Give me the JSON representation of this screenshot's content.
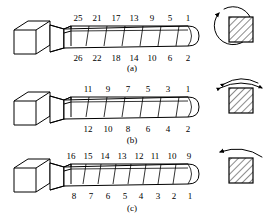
{
  "figure": {
    "panels": [
      {
        "id": "a",
        "caption": "(a)",
        "segment_count": 7,
        "top_numbers": [
          "25",
          "21",
          "17",
          "13",
          "9",
          "5",
          "1"
        ],
        "bottom_numbers": [
          "26",
          "22",
          "18",
          "14",
          "10",
          "6",
          "2"
        ],
        "cross_section": {
          "shape": "hatched-square",
          "arrow": "full-circle-rotation-arrow",
          "arrow_direction": "clockwise"
        }
      },
      {
        "id": "b",
        "caption": "(b)",
        "segment_count": 7,
        "top_numbers": [
          "11",
          "9",
          "7",
          "5",
          "3",
          "1"
        ],
        "bottom_numbers": [
          "12",
          "10",
          "8",
          "6",
          "4",
          "2"
        ],
        "cross_section": {
          "shape": "hatched-square",
          "arrow": "double-headed-arc-arrow",
          "arrow_direction": "bidirectional"
        }
      },
      {
        "id": "c",
        "caption": "(c)",
        "segment_count": 8,
        "top_numbers": [
          "16",
          "15",
          "14",
          "13",
          "12",
          "11",
          "10",
          "9"
        ],
        "bottom_numbers": [
          "8",
          "7",
          "6",
          "5",
          "4",
          "3",
          "2",
          "1"
        ],
        "cross_section": {
          "shape": "hatched-square",
          "arrow": "single-arc-arrow",
          "arrow_direction": "leftward"
        }
      }
    ],
    "colors": {
      "line": "#000000",
      "background": "#ffffff",
      "hatch": "#000000"
    }
  }
}
